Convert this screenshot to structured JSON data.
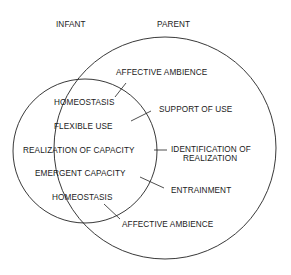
{
  "headers": {
    "infant": "INFANT",
    "parent": "PARENT"
  },
  "infant_items": [
    "HOMEOSTASIS",
    "FLEXIBLE USE",
    "REALIZATION OF CAPACITY",
    "EMERGENT CAPACITY",
    "HOMEOSTASIS"
  ],
  "parent_items": [
    "AFFECTIVE AMBIENCE",
    "SUPPORT OF USE",
    "IDENTIFICATION OF",
    "REALIZATION",
    "ENTRAINMENT",
    "AFFECTIVE AMBIENCE"
  ],
  "colors": {
    "line": "#222222",
    "background": "#ffffff"
  }
}
